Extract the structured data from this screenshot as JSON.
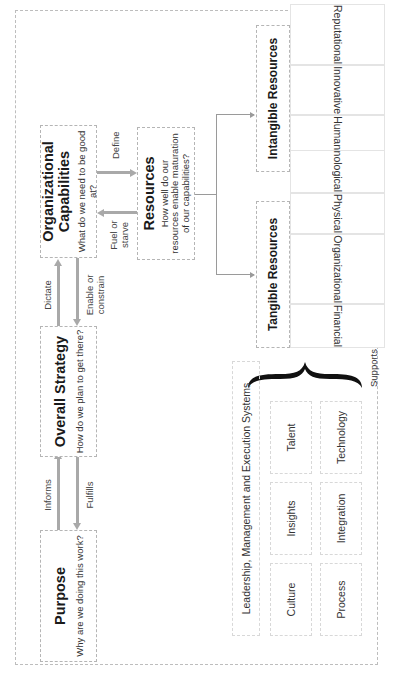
{
  "diagram": {
    "purpose": {
      "title": "Purpose",
      "subtitle": "Why are we doing this work?"
    },
    "strategy": {
      "title": "Overall Strategy",
      "subtitle": "How do we plan to get there?"
    },
    "capabilities": {
      "title_line1": "Organizational",
      "title_line2": "Capabilities",
      "subtitle": "What do we need to be good at?"
    },
    "resources": {
      "title": "Resources",
      "subtitle_line1": "How well do our",
      "subtitle_line2": "resources enable maturation",
      "subtitle_line3": "of our capabilities?"
    },
    "arrows": {
      "informs": "Informs",
      "fulfills": "Fulfills",
      "dictate": "Dictate",
      "enable_line1": "Enable or",
      "enable_line2": "constrain",
      "define": "Define",
      "fuel_line1": "Fuel or",
      "fuel_line2": "starve"
    },
    "tangible": {
      "header": "Tangible Resources",
      "items": [
        "Financial",
        "Organizational",
        "Physical",
        "Technological"
      ]
    },
    "intangible": {
      "header": "Intangible Resources",
      "items": [
        "Human",
        "Innovative",
        "Reputational"
      ]
    },
    "capability_systems": {
      "header": "Leadership, Management and Execution Systems",
      "row1": [
        "Culture",
        "Insights",
        "Talent"
      ],
      "row2": [
        "Process",
        "Integration",
        "Technology"
      ]
    },
    "supports_label": "Supports"
  }
}
